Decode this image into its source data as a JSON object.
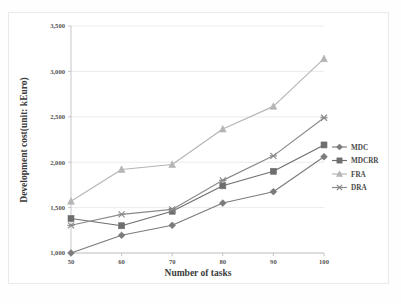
{
  "figure": {
    "background_color": "#ffffff",
    "frame_color": "#e9e9e9"
  },
  "chart_data": {
    "type": "line",
    "title": "",
    "xlabel": "Number of tasks",
    "ylabel": "Development  cost(unit: kEuro)",
    "x": [
      50,
      60,
      70,
      80,
      90,
      100
    ],
    "categories": [
      "50",
      "60",
      "70",
      "80",
      "90",
      "100"
    ],
    "xtick_labels": [
      "50",
      "60",
      "70",
      "80",
      "90",
      "100"
    ],
    "ytick_labels": [
      "1,000",
      "1,500",
      "2,000",
      "2,500",
      "3,000",
      "3,500"
    ],
    "yticks": [
      1000,
      1500,
      2000,
      2500,
      3000,
      3500
    ],
    "ylim": [
      1000,
      3500
    ],
    "xlim": [
      50,
      100
    ],
    "grid": "horizontal",
    "legend_position": "right",
    "series": [
      {
        "name": "MDC",
        "color": "#7b7b7b",
        "marker": "diamond",
        "values": [
          1000,
          1195,
          1305,
          1550,
          1675,
          2060
        ]
      },
      {
        "name": "MDCRR",
        "color": "#6e6e6e",
        "marker": "square",
        "values": [
          1380,
          1300,
          1460,
          1740,
          1900,
          2190
        ]
      },
      {
        "name": "FRA",
        "color": "#b5b5b5",
        "marker": "triangle",
        "values": [
          1570,
          1920,
          1975,
          2365,
          2615,
          3140
        ]
      },
      {
        "name": "DRA",
        "color": "#8a8a8a",
        "marker": "cross",
        "values": [
          1305,
          1425,
          1480,
          1800,
          2070,
          2490
        ]
      }
    ]
  },
  "legend": {
    "entries": [
      {
        "label": "MDC"
      },
      {
        "label": "MDCRR"
      },
      {
        "label": "FRA"
      },
      {
        "label": "DRA"
      }
    ]
  }
}
